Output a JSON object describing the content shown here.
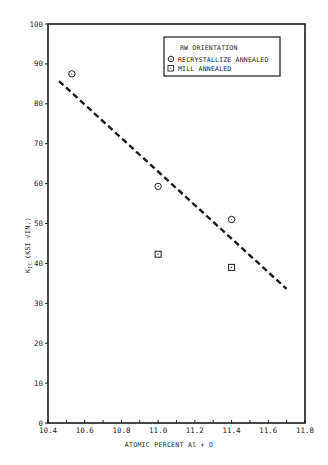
{
  "chart_data": {
    "type": "scatter",
    "title": "",
    "xlabel": "ATOMIC PERCENT Al + O",
    "ylabel": "K_IC (KSI √IN.)",
    "ylabel_parts": {
      "main": "K",
      "sub": "IC",
      "units": "(KSI",
      "sqrt": "IN.",
      "close": ")"
    },
    "xlim": [
      10.4,
      11.8
    ],
    "ylim": [
      0,
      100
    ],
    "x_ticks": [
      10.4,
      10.6,
      10.8,
      11.0,
      11.2,
      11.4,
      11.6,
      11.8
    ],
    "x_tick_labels": [
      "10.4",
      "10.6",
      "10.8",
      "11.0",
      "11.2",
      "11.4",
      "11.6",
      "11.8"
    ],
    "x_minor_ticks": [
      10.5,
      10.7,
      10.9,
      11.1,
      11.3,
      11.5,
      11.7
    ],
    "y_ticks": [
      0,
      10,
      20,
      30,
      40,
      50,
      60,
      70,
      80,
      90,
      100
    ],
    "y_tick_labels": [
      "0",
      "10",
      "20",
      "30",
      "40",
      "50",
      "60",
      "70",
      "80",
      "90",
      "100"
    ],
    "grid": false,
    "legend": {
      "position": "upper right",
      "title": "RW ORIENTATION",
      "entries": [
        {
          "label": "RECRYSTALLIZE ANNEALED",
          "marker": "circle"
        },
        {
          "label": "MILL ANNEALED",
          "marker": "square"
        }
      ]
    },
    "series": [
      {
        "name": "RECRYSTALLIZE ANNEALED",
        "marker": "circle",
        "points": [
          {
            "x": 10.53,
            "y": 87.5
          },
          {
            "x": 11.0,
            "y": 59.3
          },
          {
            "x": 11.4,
            "y": 51.0
          }
        ]
      },
      {
        "name": "MILL ANNEALED",
        "marker": "square",
        "points": [
          {
            "x": 11.0,
            "y": 42.3
          },
          {
            "x": 11.4,
            "y": 39.0
          }
        ]
      }
    ],
    "trend_line": {
      "style": "dashed",
      "x": [
        10.46,
        11.7
      ],
      "y": [
        85.7,
        33.6
      ]
    }
  },
  "colors": {
    "ink": "#1a1a1a",
    "background": "#ffffff"
  }
}
